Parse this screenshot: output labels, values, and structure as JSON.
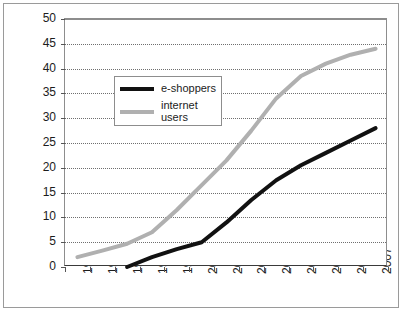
{
  "chart_data": {
    "type": "line",
    "title": "",
    "xlabel": "",
    "ylabel": "",
    "ylim": [
      0,
      50
    ],
    "ytick_step": 5,
    "yticks": [
      "0",
      "5",
      "10",
      "15",
      "20",
      "25",
      "30",
      "35",
      "40",
      "45",
      "50"
    ],
    "grid": true,
    "legend_position": "upper-left-inside",
    "x": [
      "1995",
      "1996",
      "1997",
      "1998",
      "1999",
      "2000",
      "2001",
      "2002",
      "2003",
      "2004",
      "2005",
      "2006",
      "2007"
    ],
    "series": [
      {
        "name": "e-shoppers",
        "color": "#111111",
        "values": [
          null,
          null,
          0,
          2.0,
          3.6,
          5.0,
          9.0,
          13.5,
          17.5,
          20.5,
          23.0,
          25.5,
          28.0
        ]
      },
      {
        "name": "internet users",
        "color": "#b0b0b0",
        "values": [
          2.0,
          3.3,
          4.7,
          7.0,
          11.5,
          16.5,
          21.5,
          27.5,
          34.0,
          38.5,
          41.0,
          42.8,
          44.0
        ]
      }
    ]
  },
  "legend": {
    "items": [
      {
        "label": "e-shoppers",
        "color": "#111111"
      },
      {
        "label_line1": "internet",
        "label_line2": "users",
        "color": "#b0b0b0"
      }
    ]
  }
}
